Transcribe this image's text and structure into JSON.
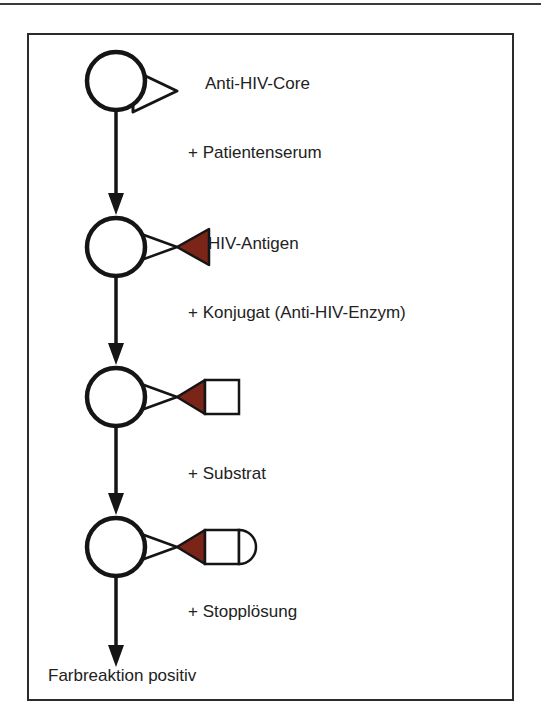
{
  "figure": {
    "kind": "elisa-assay-flow-diagram",
    "language": "de",
    "colors": {
      "antigen_fill": "#7b2418",
      "stroke": "#151515",
      "frame_border": "#2b2b2b",
      "background": "#ffffff",
      "text": "#222222"
    },
    "steps": [
      {
        "id": "step-0",
        "label": "Anti-HIV-Core",
        "shape": "circle-with-white-triangle",
        "reagent": "+ Patientenserum"
      },
      {
        "id": "step-1",
        "label": "HIV-Antigen",
        "shape": "circle-with-white-triangle-and-red-triangle",
        "reagent": "+ Konjugat (Anti-HIV-Enzym)"
      },
      {
        "id": "step-2",
        "label": "",
        "shape": "circle-white-triangle-red-triangle-square",
        "reagent": "+ Substrat"
      },
      {
        "id": "step-3",
        "label": "",
        "shape": "circle-white-triangle-red-triangle-square-rounded-cap",
        "reagent": "+ Stopplösung"
      }
    ],
    "labels": {
      "step_0": "Anti-HIV-Core",
      "step_1": "HIV-Antigen",
      "add_0": "+ Patientenserum",
      "add_1": "+ Konjugat (Anti-HIV-Enzym)",
      "add_2": "+ Substrat",
      "add_3": "+ Stopplösung",
      "result": "Farbreaktion positiv"
    }
  }
}
